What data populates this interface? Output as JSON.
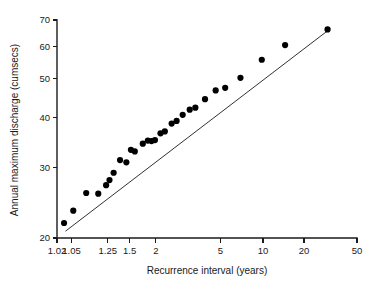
{
  "chart_data": {
    "type": "scatter",
    "title": "",
    "subtitle": "",
    "xlabel": "Recurrence interval (years)",
    "ylabel": "Annual maximum discharge (cumsecs)",
    "xscale": "gumbel-reduced-variate",
    "yscale": "log",
    "grid": false,
    "legend": false,
    "xlim": [
      1.02,
      50
    ],
    "ylim": [
      20,
      70
    ],
    "xticks": [
      "1.02",
      "1.05",
      "1.25",
      "1.5",
      "2",
      "5",
      "10",
      "20",
      "50"
    ],
    "xtick_values": [
      1.02,
      1.05,
      1.25,
      1.5,
      2,
      5,
      10,
      20,
      50
    ],
    "yticks": [
      "70",
      "60",
      "50",
      "40",
      "30",
      "20"
    ],
    "ytick_values": [
      70,
      60,
      50,
      40,
      30,
      20
    ],
    "series": [
      {
        "name": "Annual maximum discharge observations",
        "marker": "filled-circle",
        "color": "#000000",
        "points": [
          {
            "x": 1.032,
            "y": 21.8
          },
          {
            "x": 1.055,
            "y": 23.4
          },
          {
            "x": 1.105,
            "y": 25.9
          },
          {
            "x": 1.175,
            "y": 25.8
          },
          {
            "x": 1.235,
            "y": 27.1
          },
          {
            "x": 1.265,
            "y": 27.9
          },
          {
            "x": 1.305,
            "y": 29.1
          },
          {
            "x": 1.375,
            "y": 31.3
          },
          {
            "x": 1.455,
            "y": 30.9
          },
          {
            "x": 1.52,
            "y": 33.2
          },
          {
            "x": 1.58,
            "y": 32.9
          },
          {
            "x": 1.72,
            "y": 34.4
          },
          {
            "x": 1.82,
            "y": 35.0
          },
          {
            "x": 1.9,
            "y": 34.9
          },
          {
            "x": 1.98,
            "y": 35.1
          },
          {
            "x": 2.12,
            "y": 36.5
          },
          {
            "x": 2.24,
            "y": 36.9
          },
          {
            "x": 2.45,
            "y": 38.6
          },
          {
            "x": 2.62,
            "y": 39.2
          },
          {
            "x": 2.85,
            "y": 40.6
          },
          {
            "x": 3.15,
            "y": 41.8
          },
          {
            "x": 3.42,
            "y": 42.3
          },
          {
            "x": 3.95,
            "y": 44.4
          },
          {
            "x": 4.65,
            "y": 46.7
          },
          {
            "x": 5.4,
            "y": 47.4
          },
          {
            "x": 6.9,
            "y": 50.2
          },
          {
            "x": 9.8,
            "y": 55.7
          },
          {
            "x": 14.5,
            "y": 60.6
          },
          {
            "x": 30.0,
            "y": 66.3
          }
        ]
      }
    ],
    "trend_line": {
      "name": "fitted straight line",
      "color": "#1a1a1a",
      "start": {
        "x": 1.035,
        "y": 20.8
      },
      "end": {
        "x": 31.5,
        "y": 66.6
      }
    }
  }
}
